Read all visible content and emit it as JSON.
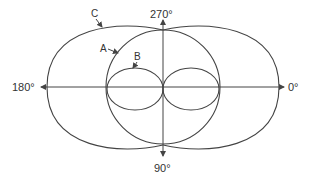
{
  "diagram": {
    "type": "polar-radiation-pattern",
    "axis_labels": {
      "right": "0°",
      "top": "270°",
      "left": "180°",
      "bottom": "90°"
    },
    "curves": [
      {
        "label": "A",
        "shape": "circle"
      },
      {
        "label": "B",
        "shape": "figure-eight (two small lobes)"
      },
      {
        "label": "C",
        "shape": "two large lobes"
      }
    ],
    "stroke_color": "#444444",
    "text_color": "#333333"
  }
}
